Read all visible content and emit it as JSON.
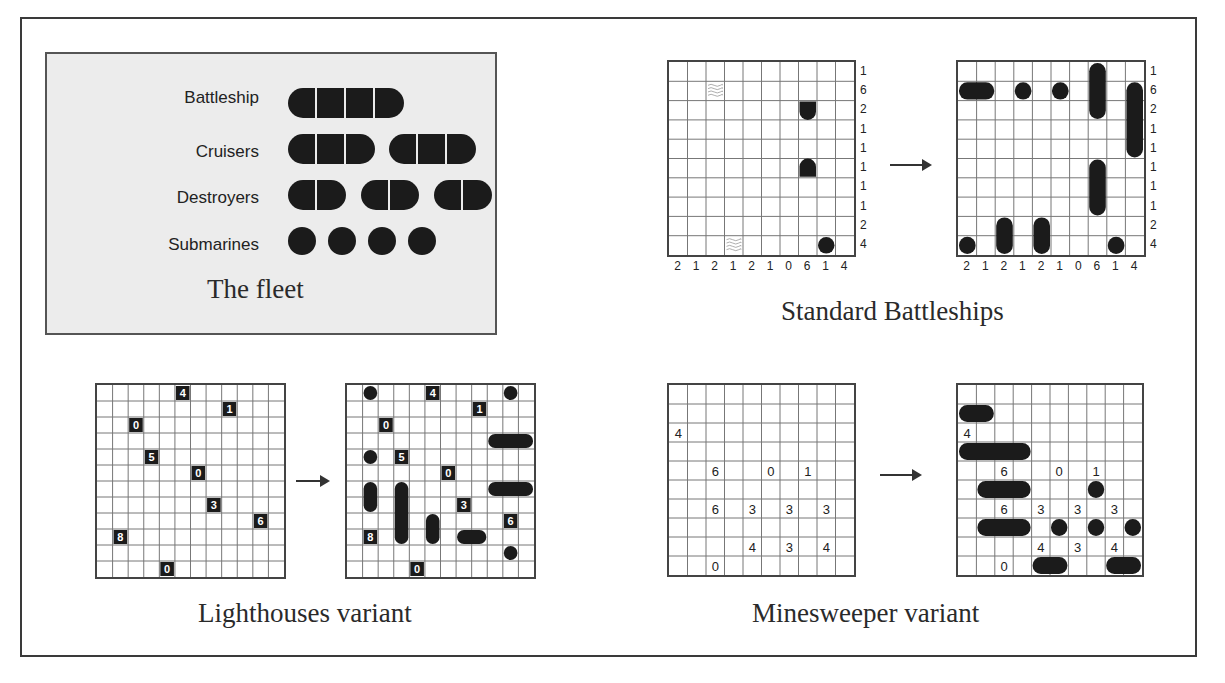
{
  "fleet": {
    "title": "The fleet",
    "rows": [
      {
        "label": "Battleship",
        "ships": [
          4
        ]
      },
      {
        "label": "Cruisers",
        "ships": [
          3,
          3
        ]
      },
      {
        "label": "Destroyers",
        "ships": [
          2,
          2,
          2
        ]
      },
      {
        "label": "Submarines",
        "ships": [
          1,
          1,
          1,
          1
        ]
      }
    ]
  },
  "standard": {
    "caption": "Standard Battleships",
    "size": 10,
    "row_clues": [
      "1",
      "6",
      "2",
      "1",
      "1",
      "1",
      "1",
      "1",
      "2",
      "4"
    ],
    "col_clues": [
      "2",
      "1",
      "2",
      "1",
      "2",
      "1",
      "0",
      "6",
      "1",
      "4"
    ],
    "puzzle_givens": [
      {
        "row": 1,
        "col": 2,
        "type": "water"
      },
      {
        "row": 2,
        "col": 7,
        "type": "ship-end-bottom"
      },
      {
        "row": 5,
        "col": 7,
        "type": "ship-end-top"
      },
      {
        "row": 9,
        "col": 3,
        "type": "water"
      },
      {
        "row": 9,
        "col": 8,
        "type": "submarine"
      }
    ],
    "solution_ships": [
      {
        "row": 0,
        "col": 7,
        "len": 3,
        "dir": "v"
      },
      {
        "row": 1,
        "col": 0,
        "len": 2,
        "dir": "h"
      },
      {
        "row": 1,
        "col": 3,
        "len": 1,
        "dir": "h"
      },
      {
        "row": 1,
        "col": 5,
        "len": 1,
        "dir": "h"
      },
      {
        "row": 1,
        "col": 9,
        "len": 4,
        "dir": "v"
      },
      {
        "row": 5,
        "col": 7,
        "len": 3,
        "dir": "v"
      },
      {
        "row": 8,
        "col": 2,
        "len": 2,
        "dir": "v"
      },
      {
        "row": 8,
        "col": 4,
        "len": 2,
        "dir": "v"
      },
      {
        "row": 9,
        "col": 0,
        "len": 1,
        "dir": "h"
      },
      {
        "row": 9,
        "col": 8,
        "len": 1,
        "dir": "h"
      }
    ]
  },
  "lighthouses": {
    "caption": "Lighthouses variant",
    "size": 12,
    "lights": [
      {
        "row": 0,
        "col": 5,
        "value": "4"
      },
      {
        "row": 1,
        "col": 8,
        "value": "1"
      },
      {
        "row": 2,
        "col": 2,
        "value": "0"
      },
      {
        "row": 4,
        "col": 3,
        "value": "5"
      },
      {
        "row": 5,
        "col": 6,
        "value": "0"
      },
      {
        "row": 7,
        "col": 7,
        "value": "3"
      },
      {
        "row": 8,
        "col": 10,
        "value": "6"
      },
      {
        "row": 9,
        "col": 1,
        "value": "8"
      },
      {
        "row": 11,
        "col": 4,
        "value": "0"
      }
    ],
    "solution_ships": [
      {
        "row": 0,
        "col": 1,
        "len": 1,
        "dir": "h"
      },
      {
        "row": 0,
        "col": 10,
        "len": 1,
        "dir": "h"
      },
      {
        "row": 3,
        "col": 9,
        "len": 3,
        "dir": "h"
      },
      {
        "row": 4,
        "col": 1,
        "len": 1,
        "dir": "h"
      },
      {
        "row": 6,
        "col": 1,
        "len": 2,
        "dir": "v"
      },
      {
        "row": 6,
        "col": 3,
        "len": 4,
        "dir": "v"
      },
      {
        "row": 6,
        "col": 9,
        "len": 3,
        "dir": "h"
      },
      {
        "row": 8,
        "col": 5,
        "len": 2,
        "dir": "v"
      },
      {
        "row": 9,
        "col": 7,
        "len": 2,
        "dir": "h"
      },
      {
        "row": 10,
        "col": 10,
        "len": 1,
        "dir": "h"
      }
    ]
  },
  "minesweeper": {
    "caption": "Minesweeper variant",
    "size": 10,
    "clues": [
      {
        "row": 2,
        "col": 0,
        "value": "4"
      },
      {
        "row": 4,
        "col": 2,
        "value": "6"
      },
      {
        "row": 4,
        "col": 5,
        "value": "0"
      },
      {
        "row": 4,
        "col": 7,
        "value": "1"
      },
      {
        "row": 6,
        "col": 2,
        "value": "6"
      },
      {
        "row": 6,
        "col": 4,
        "value": "3"
      },
      {
        "row": 6,
        "col": 6,
        "value": "3"
      },
      {
        "row": 6,
        "col": 8,
        "value": "3"
      },
      {
        "row": 8,
        "col": 4,
        "value": "4"
      },
      {
        "row": 8,
        "col": 6,
        "value": "3"
      },
      {
        "row": 8,
        "col": 8,
        "value": "4"
      },
      {
        "row": 9,
        "col": 2,
        "value": "0"
      }
    ],
    "solution_ships": [
      {
        "row": 1,
        "col": 0,
        "len": 2,
        "dir": "h"
      },
      {
        "row": 3,
        "col": 0,
        "len": 4,
        "dir": "h"
      },
      {
        "row": 5,
        "col": 1,
        "len": 3,
        "dir": "h"
      },
      {
        "row": 5,
        "col": 7,
        "len": 1,
        "dir": "h"
      },
      {
        "row": 7,
        "col": 1,
        "len": 3,
        "dir": "h"
      },
      {
        "row": 7,
        "col": 5,
        "len": 1,
        "dir": "h"
      },
      {
        "row": 7,
        "col": 7,
        "len": 1,
        "dir": "h"
      },
      {
        "row": 7,
        "col": 9,
        "len": 1,
        "dir": "h"
      },
      {
        "row": 9,
        "col": 4,
        "len": 2,
        "dir": "h"
      },
      {
        "row": 9,
        "col": 8,
        "len": 2,
        "dir": "h"
      }
    ]
  },
  "colors": {
    "ship": "#1b1b1b",
    "grid_line": "#777777",
    "fleet_bg": "#ececec"
  }
}
